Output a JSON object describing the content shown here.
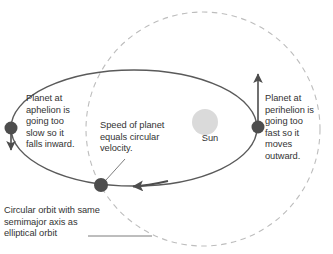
{
  "figure": {
    "type": "orbital-mechanics-diagram",
    "background_color": "#ffffff"
  },
  "sun": {
    "label": "Sun",
    "fill_color": "#d9d9d9",
    "center": [
      205,
      122
    ],
    "radius": 13
  },
  "elliptical_orbit": {
    "name": "elliptical orbit",
    "stroke_color": "#555555",
    "center": [
      134,
      128
    ],
    "semimajor_axis": 123,
    "semiminor_axis": 58
  },
  "circular_orbit": {
    "name": "circular orbit",
    "stroke_color": "#bbbbbb",
    "style": "dashed",
    "center": [
      203,
      129
    ],
    "radius": 117
  },
  "planets": [
    {
      "name": "planet-aphelion",
      "position": [
        11,
        128
      ],
      "radius": 6.5,
      "fill_color": "#4d4d4d",
      "arrow_direction": "down"
    },
    {
      "name": "planet-semimajor-crossing",
      "position": [
        101,
        185
      ],
      "radius": 7,
      "fill_color": "#4d4d4d",
      "arrow_direction": "left"
    },
    {
      "name": "planet-perihelion",
      "position": [
        258,
        127
      ],
      "radius": 6.5,
      "fill_color": "#4d4d4d",
      "arrow_direction": "up"
    }
  ],
  "labels": {
    "aphelion": "Planet at\naphelion is\ngoing too\nslow so it\nfalls inward.",
    "center": "Speed of planet\nequals circular\nvelocity.",
    "perihelion": "Planet at\nperihelion is\ngoing too\nfast so it\nmoves\noutward.",
    "circular_orbit": "Circular orbit with same\nsemimajor axis as\nelliptical orbit",
    "sun": "Sun"
  }
}
